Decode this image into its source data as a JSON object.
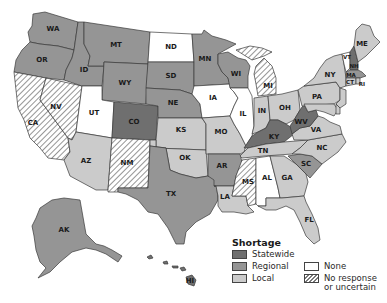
{
  "colors": {
    "statewide": "#6f6f6f",
    "regional": "#959595",
    "local": "#cbcbcb",
    "none": "#ffffff",
    "no_response_bg": "#ffffff",
    "no_response_hatch": "#7a7a7a",
    "border": "#3a3a3a"
  },
  "legend": {
    "title": "Shortage",
    "items": [
      {
        "key": "statewide",
        "label": "Statewide"
      },
      {
        "key": "regional",
        "label": "Regional"
      },
      {
        "key": "local",
        "label": "Local"
      },
      {
        "key": "none",
        "label": "None"
      },
      {
        "key": "no_response",
        "label_line1": "No response",
        "label_line2": "or uncertain"
      }
    ]
  },
  "states": {
    "WA": {
      "label": "WA",
      "category": "regional"
    },
    "OR": {
      "label": "OR",
      "category": "regional"
    },
    "CA": {
      "label": "CA",
      "category": "no_response"
    },
    "NV": {
      "label": "NV",
      "category": "no_response"
    },
    "ID": {
      "label": "ID",
      "category": "regional"
    },
    "MT": {
      "label": "MT",
      "category": "regional"
    },
    "WY": {
      "label": "WY",
      "category": "regional"
    },
    "UT": {
      "label": "UT",
      "category": "none"
    },
    "AZ": {
      "label": "AZ",
      "category": "local"
    },
    "CO": {
      "label": "CO",
      "category": "statewide"
    },
    "NM": {
      "label": "NM",
      "category": "no_response"
    },
    "ND": {
      "label": "ND",
      "category": "none"
    },
    "SD": {
      "label": "SD",
      "category": "regional"
    },
    "NE": {
      "label": "NE",
      "category": "regional"
    },
    "KS": {
      "label": "KS",
      "category": "local"
    },
    "OK": {
      "label": "OK",
      "category": "local"
    },
    "TX": {
      "label": "TX",
      "category": "regional"
    },
    "MN": {
      "label": "MN",
      "category": "regional"
    },
    "IA": {
      "label": "IA",
      "category": "none"
    },
    "MO": {
      "label": "MO",
      "category": "local"
    },
    "AR": {
      "label": "AR",
      "category": "regional"
    },
    "LA": {
      "label": "LA",
      "category": "local"
    },
    "WI": {
      "label": "WI",
      "category": "regional"
    },
    "IL": {
      "label": "IL",
      "category": "none"
    },
    "MI": {
      "label": "MI",
      "category": "no_response"
    },
    "IN": {
      "label": "IN",
      "category": "local"
    },
    "OH": {
      "label": "OH",
      "category": "local"
    },
    "KY": {
      "label": "KY",
      "category": "statewide"
    },
    "TN": {
      "label": "TN",
      "category": "local"
    },
    "MS": {
      "label": "MS",
      "category": "no_response"
    },
    "AL": {
      "label": "AL",
      "category": "none"
    },
    "GA": {
      "label": "GA",
      "category": "local"
    },
    "FL": {
      "label": "FL",
      "category": "local"
    },
    "SC": {
      "label": "SC",
      "category": "regional"
    },
    "NC": {
      "label": "NC",
      "category": "local"
    },
    "VA": {
      "label": "VA",
      "category": "local"
    },
    "WV": {
      "label": "WV",
      "category": "statewide"
    },
    "PA": {
      "label": "PA",
      "category": "local"
    },
    "NY": {
      "label": "NY",
      "category": "local"
    },
    "VT": {
      "label": "VT",
      "category": "none"
    },
    "NH": {
      "label": "NH",
      "category": "statewide"
    },
    "ME": {
      "label": "ME",
      "category": "local"
    },
    "MA": {
      "label": "MA",
      "category": "regional"
    },
    "CT": {
      "label": "CT",
      "category": "local"
    },
    "RI": {
      "label": "RI",
      "category": "local"
    },
    "NJ": {
      "label": "NJ",
      "category": "local"
    },
    "DE": {
      "label": "DE",
      "category": "local"
    },
    "MD": {
      "label": "MD",
      "category": "local"
    },
    "AK": {
      "label": "AK",
      "category": "regional"
    },
    "HI": {
      "label": "HI",
      "category": "statewide"
    }
  }
}
